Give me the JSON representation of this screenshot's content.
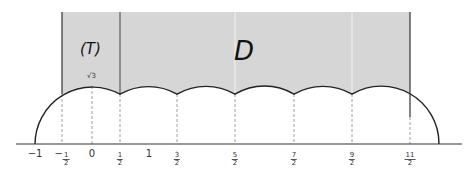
{
  "diagram": {
    "region_labels": {
      "T": "(T)",
      "D": "D"
    },
    "arc_label": "√3",
    "axis_ticks": [
      {
        "id": "m1",
        "x": 35,
        "text": "−1",
        "num": "",
        "den": ""
      },
      {
        "id": "mhalf",
        "x": 62,
        "text": "−",
        "num": "1",
        "den": "2"
      },
      {
        "id": "zero",
        "x": 92,
        "text": "0",
        "num": "",
        "den": ""
      },
      {
        "id": "half",
        "x": 120,
        "text": "",
        "num": "1",
        "den": "2"
      },
      {
        "id": "one",
        "x": 149,
        "text": "1",
        "num": "",
        "den": ""
      },
      {
        "id": "three-halves",
        "x": 177,
        "text": "",
        "num": "3",
        "den": "2"
      },
      {
        "id": "five-halves",
        "x": 235,
        "text": "",
        "num": "5",
        "den": "2"
      },
      {
        "id": "seven-halves",
        "x": 294,
        "text": "",
        "num": "7",
        "den": "2"
      },
      {
        "id": "nine-halves",
        "x": 352,
        "text": "",
        "num": "9",
        "den": "2"
      },
      {
        "id": "eleven-halves",
        "x": 410,
        "text": "",
        "num": "11",
        "den": "2"
      }
    ],
    "colors": {
      "region_fill": "#d6d6d6",
      "curve": "#222222",
      "axis": "#333333",
      "dash": "#888888"
    }
  }
}
